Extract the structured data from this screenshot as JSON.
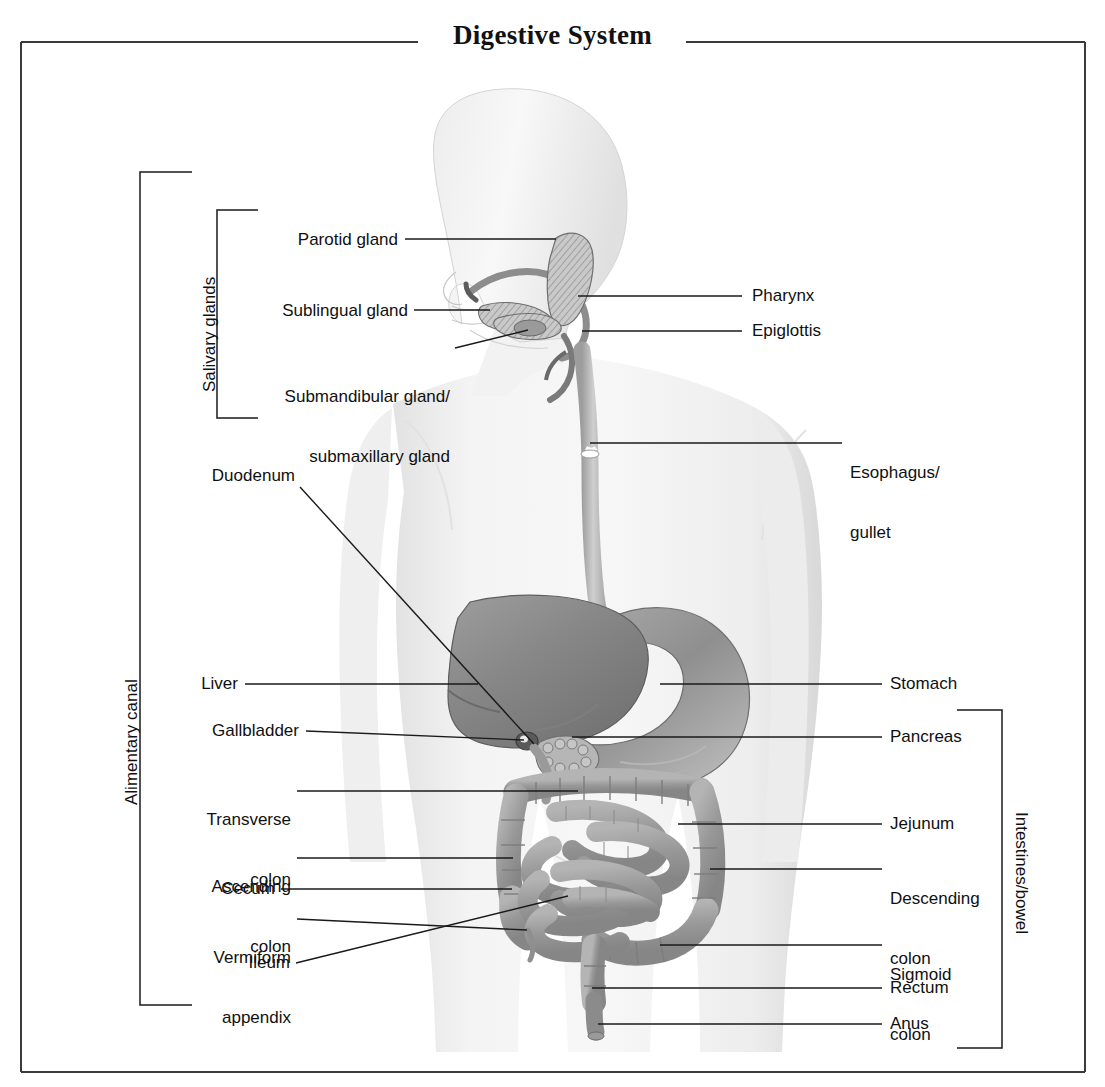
{
  "figure": {
    "title": "Digestive System",
    "type": "anatomical-diagram",
    "line_color": "#1a1a1a",
    "frame_color": "#3a3a3a",
    "background": "#ffffff"
  },
  "brackets": {
    "alimentary_canal": {
      "label": "Alimentary canal"
    },
    "salivary_glands": {
      "label": "Salivary glands"
    },
    "intestines": {
      "label": "Intestines/bowel"
    }
  },
  "labels_left": [
    {
      "id": "parotid-gland",
      "text": "Parotid gland"
    },
    {
      "id": "sublingual-gland",
      "text": "Sublingual gland"
    },
    {
      "id": "submandibular-gland",
      "line1": "Submandibular gland/",
      "line2": "submaxillary gland"
    },
    {
      "id": "duodenum",
      "text": "Duodenum"
    },
    {
      "id": "liver",
      "text": "Liver"
    },
    {
      "id": "gallbladder",
      "text": "Gallbladder"
    },
    {
      "id": "transverse-colon",
      "line1": "Transverse",
      "line2": "colon"
    },
    {
      "id": "ascending-colon",
      "line1": "Ascending",
      "line2": "colon"
    },
    {
      "id": "cecum",
      "text": "Cecum"
    },
    {
      "id": "vermiform-appendix",
      "line1": "Vermiform",
      "line2": "appendix"
    },
    {
      "id": "ileum",
      "text": "Ileum"
    }
  ],
  "labels_right": [
    {
      "id": "pharynx",
      "text": "Pharynx"
    },
    {
      "id": "epiglottis",
      "text": "Epiglottis"
    },
    {
      "id": "esophagus",
      "line1": "Esophagus/",
      "line2": "gullet"
    },
    {
      "id": "stomach",
      "text": "Stomach"
    },
    {
      "id": "pancreas",
      "text": "Pancreas"
    },
    {
      "id": "jejunum",
      "text": "Jejunum"
    },
    {
      "id": "descending-colon",
      "line1": "Descending",
      "line2": "colon"
    },
    {
      "id": "sigmoid-colon",
      "line1": "Sigmoid",
      "line2": "colon"
    },
    {
      "id": "rectum",
      "text": "Rectum"
    },
    {
      "id": "anus",
      "text": "Anus"
    }
  ]
}
